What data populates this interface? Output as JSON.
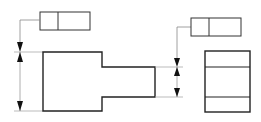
{
  "diagram": {
    "type": "technical-drawing",
    "colors": {
      "outline": "#222222",
      "thin_line": "#888888",
      "background": "#ffffff"
    },
    "front_view": {
      "body": "rectangle with rightward stem"
    },
    "side_view": {
      "body": "rectangle with two horizontal divisions"
    },
    "feature_control_frames": [
      {
        "id": "left-frame",
        "cells": [
          "",
          ""
        ]
      },
      {
        "id": "right-frame",
        "cells": [
          "",
          ""
        ]
      }
    ]
  }
}
